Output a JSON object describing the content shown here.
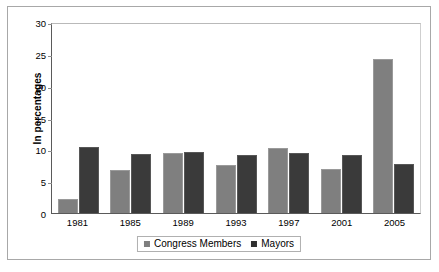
{
  "chart_data": {
    "type": "bar",
    "title": "",
    "xlabel": "",
    "ylabel": "In percentages",
    "ylim": [
      0,
      30
    ],
    "yticks": [
      0,
      5,
      10,
      15,
      20,
      25,
      30
    ],
    "grid": false,
    "legend_position": "bottom",
    "categories": [
      "1981",
      "1985",
      "1989",
      "1993",
      "1997",
      "2001",
      "2005"
    ],
    "series": [
      {
        "name": "Congress Members",
        "color": "#7f7f7f",
        "values": [
          2.2,
          6.7,
          9.4,
          7.5,
          10.2,
          6.9,
          24.2
        ]
      },
      {
        "name": "Mayors",
        "color": "#3a3a3a",
        "values": [
          10.3,
          9.3,
          9.6,
          9.1,
          9.4,
          9.1,
          7.7
        ]
      }
    ]
  }
}
